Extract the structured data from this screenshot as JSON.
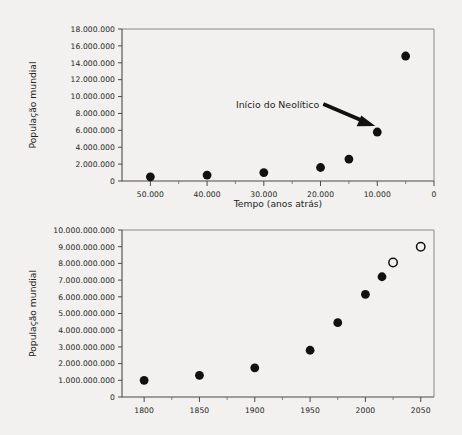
{
  "page": {
    "background_color": "#f2f1ef",
    "point_color": "#111111",
    "axis_color": "#4c4a48"
  },
  "chart_data": [
    {
      "id": "top",
      "type": "scatter",
      "title": "",
      "xlabel": "Tempo (anos atrás)",
      "ylabel": "População mundial",
      "xlim": [
        55000,
        0
      ],
      "ylim": [
        0,
        18000000
      ],
      "x_reversed": true,
      "grid": false,
      "legend": "none",
      "xticks": [
        50000,
        40000,
        30000,
        20000,
        10000,
        0
      ],
      "xticklabels": [
        "50.000",
        "40.000",
        "30.000",
        "20.000",
        "10.000",
        "0"
      ],
      "yticks": [
        0,
        2000000,
        4000000,
        6000000,
        8000000,
        10000000,
        12000000,
        14000000,
        16000000,
        18000000
      ],
      "yticklabels": [
        "0",
        "2.000.000",
        "4.000.000",
        "6.000.000",
        "8.000.000",
        "10.000.000",
        "12.000.000",
        "14.000.000",
        "16.000.000",
        "18.000.000"
      ],
      "series": [
        {
          "name": "População estimada",
          "marker": "filled-circle",
          "x": [
            50000,
            40000,
            30000,
            20000,
            15000,
            10000,
            5000
          ],
          "y": [
            500000,
            700000,
            1000000,
            1600000,
            2600000,
            5800000,
            14800000
          ]
        }
      ],
      "annotations": [
        {
          "text": "Início do Neolítico",
          "points_to_x": 10000,
          "points_to_y": 5800000,
          "arrow": true
        }
      ]
    },
    {
      "id": "bottom",
      "type": "scatter",
      "title": "",
      "xlabel": "",
      "ylabel": "População mundial",
      "xlim": [
        1780,
        2062
      ],
      "ylim": [
        0,
        10000000000
      ],
      "x_reversed": false,
      "grid": false,
      "legend": "none",
      "xticks": [
        1800,
        1850,
        1900,
        1950,
        2000,
        2050
      ],
      "xticklabels": [
        "1800",
        "1850",
        "1900",
        "1950",
        "2000",
        "2050"
      ],
      "yticks": [
        0,
        1000000000,
        2000000000,
        3000000000,
        4000000000,
        5000000000,
        6000000000,
        7000000000,
        8000000000,
        9000000000,
        10000000000
      ],
      "yticklabels": [
        "0",
        "1.000.000.000",
        "2.000.000.000",
        "3.000.000.000",
        "4.000.000.000",
        "5.000.000.000",
        "6.000.000.000",
        "7.000.000.000",
        "8.000.000.000",
        "9.000.000.000",
        "10.000.000.000"
      ],
      "series": [
        {
          "name": "População observada",
          "marker": "filled-circle",
          "x": [
            1800,
            1850,
            1900,
            1950,
            1975,
            2000,
            2015
          ],
          "y": [
            1000000000,
            1300000000,
            1750000000,
            2800000000,
            4450000000,
            6150000000,
            7200000000
          ]
        },
        {
          "name": "População projetada",
          "marker": "open-circle",
          "x": [
            2025,
            2050
          ],
          "y": [
            8050000000,
            9000000000
          ]
        }
      ],
      "annotations": []
    }
  ]
}
